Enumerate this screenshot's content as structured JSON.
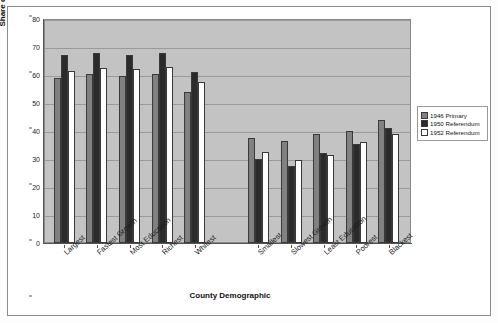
{
  "chart_data": {
    "type": "bar",
    "title": "",
    "xlabel": "County Demographic",
    "ylabel": "Share of Loyalist vote",
    "ylim": [
      0,
      80
    ],
    "ytick_step": 10,
    "yticks": [
      0,
      10,
      20,
      30,
      40,
      50,
      60,
      70,
      80
    ],
    "grid": true,
    "legend_position": "right",
    "categories": [
      "Largest",
      "Fastest Growth",
      "Most Education",
      "Richest",
      "Whitest",
      "Smallest",
      "Slowest Growth",
      "Least Education",
      "Poorest",
      "Blackest"
    ],
    "group_gap_after_index": 4,
    "series": [
      {
        "name": "1946 Primary",
        "color": "#818181",
        "values": [
          59,
          60.5,
          59.5,
          60.5,
          54,
          37.5,
          36.5,
          39,
          40,
          44
        ]
      },
      {
        "name": "1950 Referendum",
        "color": "#2b2b2b",
        "values": [
          67,
          68,
          67,
          68,
          61,
          30,
          27.5,
          32,
          35.5,
          41
        ]
      },
      {
        "name": "1952 Referendum",
        "color": "#fefefe",
        "values": [
          61.5,
          62.5,
          62,
          63,
          57.5,
          32.5,
          29.5,
          31.5,
          36,
          39
        ]
      }
    ]
  },
  "legend": {
    "items": [
      {
        "label": "1946 Primary",
        "color": "#818181"
      },
      {
        "label": "1950 Referendum",
        "color": "#2b2b2b"
      },
      {
        "label": "1952 Referendum",
        "color": "#fefefe"
      }
    ]
  }
}
